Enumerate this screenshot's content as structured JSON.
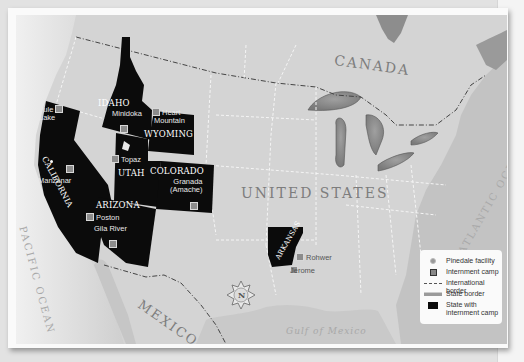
{
  "map": {
    "countries": [
      "CANADA",
      "UNITED STATES",
      "MEXICO"
    ],
    "oceans": [
      "PACIFIC OCEAN",
      "ATLANTIC OCEAN"
    ],
    "water_bodies": [
      "Gulf of Mexico"
    ],
    "compass": {
      "letter": "N"
    },
    "states_with_camps": [
      {
        "name": "CALIFORNIA",
        "camps": [
          "Tule Lake",
          "Manzanar"
        ]
      },
      {
        "name": "IDAHO",
        "camps": [
          "Minidoka"
        ]
      },
      {
        "name": "WYOMING",
        "camps": [
          "Heart Mountain"
        ]
      },
      {
        "name": "UTAH",
        "camps": [
          "Topaz"
        ]
      },
      {
        "name": "COLORADO",
        "camps": [
          "Granada (Amache)"
        ]
      },
      {
        "name": "ARIZONA",
        "camps": [
          "Poston",
          "Gila River"
        ]
      },
      {
        "name": "ARKANSAS",
        "camps": [
          "Rohwer",
          "Jerome"
        ]
      }
    ],
    "labels": {
      "tule_1": "Tule",
      "tule_2": "Lake",
      "manzanar": "Manzanar",
      "minidoka": "Minidoka",
      "heart_1": "Heart",
      "heart_2": "Mountain",
      "topaz": "Topaz",
      "granada_1": "Granada",
      "granada_2": "(Amache)",
      "poston": "Poston",
      "gila": "Gila River",
      "rohwer": "Rohwer",
      "jerome": "Jerome",
      "california": "CALIFORNIA",
      "idaho": "IDAHO",
      "wyoming": "WYOMING",
      "utah": "UTAH",
      "colorado": "COLORADO",
      "arizona": "ARIZONA",
      "arkansas": "ARKANSAS",
      "canada": "CANADA",
      "usa": "UNITED STATES",
      "mexico": "MEXICO",
      "pacific": "PACIFIC OCEAN",
      "atlantic": "ATLANTIC OCEAN",
      "gulf": "Gulf of Mexico",
      "compass_n": "N"
    }
  },
  "legend": {
    "items": [
      {
        "label": "Pinedale facility",
        "symbol": "dot"
      },
      {
        "label": "Internment camp",
        "symbol": "square"
      },
      {
        "label": "International border",
        "symbol": "dash-dot-line"
      },
      {
        "label": "State border",
        "symbol": "double-line"
      },
      {
        "label": "State with internment camp",
        "symbol": "black-box"
      }
    ],
    "item_0": "Pinedale facility",
    "item_1": "Internment camp",
    "item_2": "International border",
    "item_3": "State border",
    "item_4a": "State with",
    "item_4b": "internment camp"
  },
  "colors": {
    "land": "#d4d4d4",
    "water": "#c4c4c4",
    "camp_state": "#0a0a0a",
    "label_gray": "#7d7d7d",
    "frame": "#fafafa"
  }
}
